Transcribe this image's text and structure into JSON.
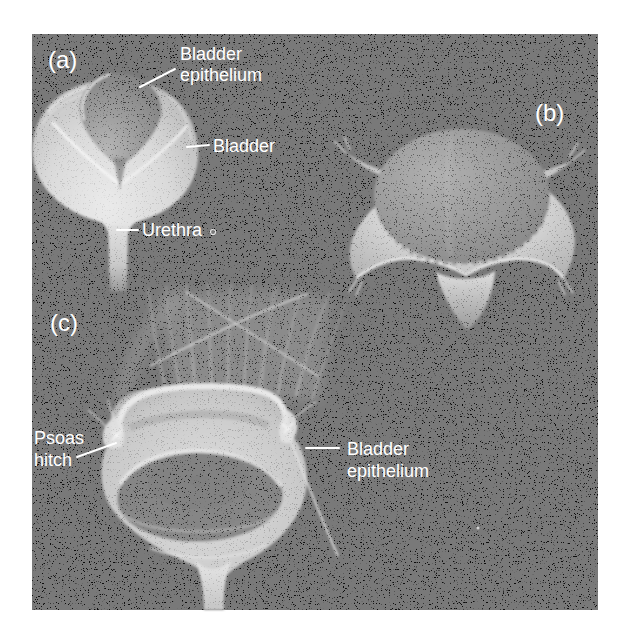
{
  "figure": {
    "page_background": "#ffffff",
    "photo_background": "#0b0b0b",
    "label_color": "#ffffff",
    "panel_a": {
      "label": "(a)",
      "annotations": {
        "bladder_epithelium": {
          "line1": "Bladder",
          "line2": "epithelium"
        },
        "bladder": "Bladder",
        "urethra": "Urethra"
      }
    },
    "panel_b": {
      "label": "(b)"
    },
    "panel_c": {
      "label": "(c)",
      "annotations": {
        "psoas_hitch": {
          "line1": "Psoas",
          "line2": "hitch"
        },
        "bladder_epithelium": {
          "line1": "Bladder",
          "line2": "epithelium"
        }
      }
    }
  }
}
